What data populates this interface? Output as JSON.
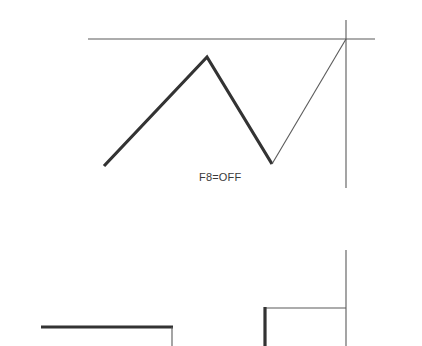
{
  "canvas": {
    "width": 422,
    "height": 346,
    "background": "#ffffff"
  },
  "styles": {
    "thick_stroke_color": "#333333",
    "thin_stroke_color": "#5a5a5a",
    "thick_stroke_width": 3.2,
    "thin_stroke_width": 1.1,
    "label_color": "#3a3a3a"
  },
  "labels": {
    "mode_status": "F8=OFF"
  },
  "upper_view": {
    "axis_horizontal": {
      "x1": 88,
      "y1": 39,
      "x2": 375,
      "y2": 39
    },
    "axis_vertical": {
      "x1": 346,
      "y1": 20,
      "x2": 346,
      "y2": 188
    },
    "polyline_thick_points": "104,166 207,57 272,164",
    "rubber_band_line": {
      "x1": 272,
      "y1": 164,
      "x2": 346,
      "y2": 39
    }
  },
  "lower_view": {
    "axis_vertical": {
      "x1": 346,
      "y1": 250,
      "x2": 346,
      "y2": 346
    },
    "thin_horizontal": {
      "x1": 265,
      "y1": 308,
      "x2": 346,
      "y2": 308
    },
    "thick_vertical_right": {
      "x1": 265,
      "y1": 307,
      "x2": 265,
      "y2": 346
    },
    "thick_horizontal_left": {
      "x1": 41,
      "y1": 327,
      "x2": 173,
      "y2": 327
    },
    "thin_vertical_left": {
      "x1": 172,
      "y1": 327,
      "x2": 172,
      "y2": 346
    }
  }
}
